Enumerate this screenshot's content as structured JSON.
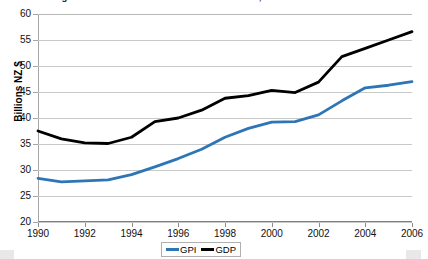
{
  "title": "Genuine Progress Indicator and Gross Domestic Product, New Zealand",
  "y_axis_title": "Billions NZ $",
  "y_tick_labels": [
    "60",
    "55",
    "50",
    "45",
    "40",
    "35",
    "30",
    "25",
    "20"
  ],
  "x_tick_labels": [
    "1990",
    "1992",
    "1994",
    "1996",
    "1998",
    "2000",
    "2002",
    "2004",
    "2006"
  ],
  "legend": {
    "entries": [
      {
        "label": "GPI",
        "color": "#2E75B6"
      },
      {
        "label": "GDP",
        "color": "#000000"
      }
    ]
  },
  "colors": {
    "gpi_line": "#2E75B6",
    "gdp_line": "#000000",
    "gridline": "#c9c9c9",
    "axis": "#a6a6a6",
    "plot_background": "#ffffff"
  },
  "chart_data": {
    "type": "line",
    "title": "Genuine Progress Indicator and Gross Domestic Product, New Zealand",
    "xlabel": "",
    "ylabel": "Billions NZ $",
    "xlim": [
      1990,
      2006
    ],
    "ylim": [
      20,
      60
    ],
    "ytick_step": 5,
    "xtick_step": 2,
    "grid": "horizontal",
    "legend_position": "bottom-center",
    "x": [
      1990,
      1991,
      1992,
      1993,
      1994,
      1995,
      1996,
      1997,
      1998,
      1999,
      2000,
      2001,
      2002,
      2003,
      2004,
      2005,
      2006
    ],
    "series": [
      {
        "name": "GPI",
        "color": "#2E75B6",
        "values": [
          28.4,
          27.7,
          27.9,
          28.1,
          29.1,
          30.6,
          32.2,
          34.0,
          36.3,
          38.0,
          39.2,
          39.3,
          40.6,
          43.3,
          45.8,
          46.3,
          47.0
        ]
      },
      {
        "name": "GDP",
        "color": "#000000",
        "values": [
          37.5,
          36.0,
          35.2,
          35.1,
          36.3,
          39.3,
          40.0,
          41.5,
          43.8,
          44.3,
          45.3,
          44.9,
          46.9,
          51.8,
          53.4,
          55.0,
          56.6
        ]
      }
    ]
  }
}
